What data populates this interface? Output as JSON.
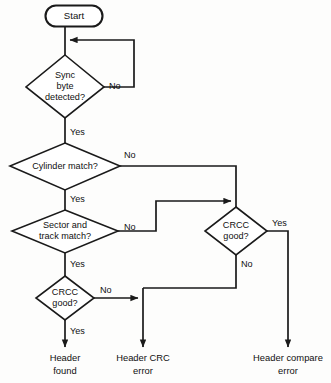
{
  "diagram": {
    "type": "flowchart",
    "background_color": "#fdfdfc",
    "line_color": "#1a1a1a",
    "text_color": "#101010",
    "nodes": [
      {
        "id": "start",
        "shape": "terminator",
        "label": "Start",
        "cx": 74,
        "cy": 16
      },
      {
        "id": "sync",
        "shape": "decision",
        "label_line1": "Sync",
        "label_line2": "byte",
        "label_line3": "detected?",
        "cx": 65,
        "cy": 87
      },
      {
        "id": "cylinder",
        "shape": "decision",
        "label_line1": "Cylinder match?",
        "cx": 65,
        "cy": 166
      },
      {
        "id": "sector",
        "shape": "decision",
        "label_line1": "Sector and",
        "label_line2": "track match?",
        "cx": 65,
        "cy": 231
      },
      {
        "id": "crcc_left",
        "shape": "decision",
        "label_line1": "CRCC",
        "label_line2": "good?",
        "cx": 65,
        "cy": 298
      },
      {
        "id": "crcc_right",
        "shape": "decision",
        "label_line1": "CRCC",
        "label_line2": "good?",
        "cx": 236,
        "cy": 231
      }
    ],
    "edge_labels": [
      {
        "id": "sync-no",
        "text": "No",
        "x": 109,
        "y": 87
      },
      {
        "id": "sync-yes",
        "text": "Yes",
        "x": 70,
        "y": 133
      },
      {
        "id": "cylinder-no",
        "text": "No",
        "x": 124,
        "y": 156
      },
      {
        "id": "cylinder-yes",
        "text": "Yes",
        "x": 70,
        "y": 200
      },
      {
        "id": "sector-no",
        "text": "No",
        "x": 124,
        "y": 228
      },
      {
        "id": "sector-yes",
        "text": "Yes",
        "x": 70,
        "y": 265
      },
      {
        "id": "crcc-left-no",
        "text": "No",
        "x": 100,
        "y": 291
      },
      {
        "id": "crcc-left-yes",
        "text": "Yes",
        "x": 70,
        "y": 332
      },
      {
        "id": "crcc-right-yes",
        "text": "Yes",
        "x": 272,
        "y": 224
      },
      {
        "id": "crcc-right-no",
        "text": "No",
        "x": 241,
        "y": 265
      }
    ],
    "terminals": [
      {
        "id": "header-found",
        "line1": "Header",
        "line2": "found",
        "x": 65,
        "y1": 358,
        "y2": 371
      },
      {
        "id": "header-crc",
        "line1": "Header CRC",
        "line2": "error",
        "x": 143,
        "y1": 358,
        "y2": 371
      },
      {
        "id": "header-compare",
        "line1": "Header compare",
        "line2": "error",
        "x": 288,
        "y1": 358,
        "y2": 371
      }
    ],
    "caption": ""
  }
}
